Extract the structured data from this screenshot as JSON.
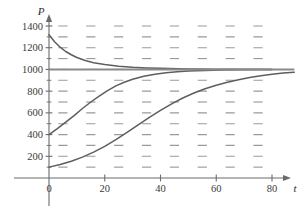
{
  "chart_data": {
    "type": "line",
    "title": "",
    "subtitle": "",
    "xlabel": "t",
    "ylabel": "P",
    "xlim": [
      0,
      88
    ],
    "ylim": [
      0,
      1480
    ],
    "grid": false,
    "legend": "none",
    "x_ticks": [
      0,
      20,
      40,
      60,
      80
    ],
    "x_tick_labels": [
      "0",
      "20",
      "40",
      "60",
      "80"
    ],
    "y_ticks": [
      200,
      400,
      600,
      800,
      1000,
      1200,
      1400
    ],
    "y_tick_labels": [
      "200",
      "400",
      "600",
      "800",
      "1000",
      "1200",
      "1400"
    ],
    "y_minor_tick_step": 100,
    "carrying_capacity": 1000,
    "direction_field": {
      "description": "slope field of logistic equation dP/dt = k*P*(1 - P/1000)",
      "t_grid": [
        5,
        15,
        25,
        35,
        45,
        55,
        65,
        75
      ],
      "P_grid": [
        100,
        200,
        300,
        400,
        500,
        600,
        700,
        800,
        900,
        1000,
        1100,
        1200,
        1300,
        1400
      ],
      "equilibrium_P": 1000,
      "mark_color": "#9a9a9a"
    },
    "series": [
      {
        "name": "solution-from-1320",
        "initial_P": 1320,
        "points": [
          [
            0,
            1320
          ],
          [
            2,
            1255
          ],
          [
            4,
            1205
          ],
          [
            6,
            1165
          ],
          [
            8,
            1135
          ],
          [
            10,
            1110
          ],
          [
            13,
            1082
          ],
          [
            16,
            1062
          ],
          [
            20,
            1045
          ],
          [
            25,
            1030
          ],
          [
            30,
            1020
          ],
          [
            35,
            1014
          ],
          [
            40,
            1010
          ],
          [
            50,
            1005
          ],
          [
            60,
            1002
          ],
          [
            70,
            1001
          ],
          [
            80,
            1000
          ]
        ]
      },
      {
        "name": "solution-from-400",
        "initial_P": 400,
        "points": [
          [
            0,
            400
          ],
          [
            3,
            455
          ],
          [
            6,
            515
          ],
          [
            9,
            575
          ],
          [
            12,
            640
          ],
          [
            15,
            700
          ],
          [
            18,
            755
          ],
          [
            21,
            805
          ],
          [
            24,
            848
          ],
          [
            27,
            882
          ],
          [
            30,
            910
          ],
          [
            34,
            938
          ],
          [
            38,
            956
          ],
          [
            42,
            969
          ],
          [
            46,
            978
          ],
          [
            50,
            985
          ],
          [
            56,
            991
          ],
          [
            62,
            995
          ],
          [
            70,
            998
          ],
          [
            80,
            1000
          ]
        ]
      },
      {
        "name": "solution-from-100",
        "initial_P": 100,
        "points": [
          [
            0,
            100
          ],
          [
            4,
            125
          ],
          [
            8,
            155
          ],
          [
            12,
            192
          ],
          [
            16,
            238
          ],
          [
            20,
            292
          ],
          [
            24,
            354
          ],
          [
            28,
            420
          ],
          [
            32,
            490
          ],
          [
            36,
            558
          ],
          [
            40,
            622
          ],
          [
            44,
            683
          ],
          [
            48,
            737
          ],
          [
            52,
            783
          ],
          [
            56,
            822
          ],
          [
            60,
            855
          ],
          [
            64,
            882
          ],
          [
            68,
            905
          ],
          [
            72,
            925
          ],
          [
            76,
            942
          ],
          [
            80,
            955
          ],
          [
            84,
            966
          ],
          [
            88,
            975
          ]
        ]
      },
      {
        "name": "equilibrium-solution",
        "initial_P": 1000,
        "points": [
          [
            0,
            1000
          ],
          [
            88,
            1000
          ]
        ]
      }
    ]
  }
}
